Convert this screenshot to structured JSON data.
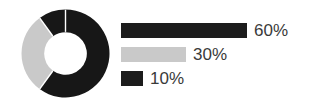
{
  "chart_data": {
    "type": "pie",
    "variant": "donut",
    "title": "",
    "subtitle": "",
    "xlabel": "",
    "ylabel": "",
    "categories": [
      "60%",
      "30%",
      "10%"
    ],
    "values": [
      60,
      30,
      10
    ],
    "value_labels": [
      "60%",
      "30%",
      "10%"
    ],
    "unit": "%",
    "total": 100,
    "grid": false,
    "legend_position": "right",
    "start_angle_deg": 0,
    "direction": "clockwise",
    "inner_radius_ratio": 0.48,
    "slices": [
      {
        "label": "60%",
        "value": 60,
        "color": "#171717",
        "start_angle_deg": 0,
        "end_angle_deg": 216
      },
      {
        "label": "30%",
        "value": 30,
        "color": "#c9c9c9",
        "start_angle_deg": 216,
        "end_angle_deg": 324
      },
      {
        "label": "10%",
        "value": 10,
        "color": "#171717",
        "start_angle_deg": 324,
        "end_angle_deg": 360
      }
    ],
    "legend": [
      {
        "label": "60%",
        "value": 60,
        "color": "#1c1c1c",
        "bar_width_px": 126
      },
      {
        "label": "30%",
        "value": 30,
        "color": "#c9c9c9",
        "bar_width_px": 65
      },
      {
        "label": "10%",
        "value": 10,
        "color": "#1c1c1c",
        "bar_width_px": 22
      }
    ]
  },
  "colors": {
    "background": "#ffffff",
    "dark": "#171717",
    "light_gray": "#c9c9c9",
    "text": "#3a3a3a",
    "separator": "#ffffff"
  }
}
